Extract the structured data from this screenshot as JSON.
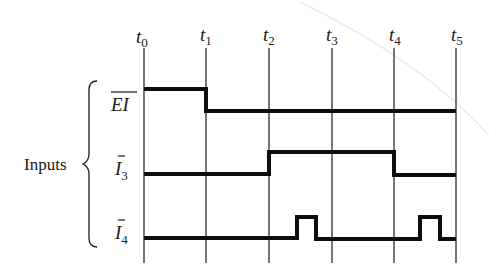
{
  "diagram": {
    "type": "timing-diagram",
    "group_label": "Inputs",
    "time_markers": [
      {
        "base": "t",
        "sub": "0",
        "x": 144
      },
      {
        "base": "t",
        "sub": "1",
        "x": 206
      },
      {
        "base": "t",
        "sub": "2",
        "x": 269
      },
      {
        "base": "t",
        "sub": "3",
        "x": 332
      },
      {
        "base": "t",
        "sub": "4",
        "x": 394
      },
      {
        "base": "t",
        "sub": "5",
        "x": 456
      }
    ],
    "signals": [
      {
        "name": "EI",
        "base": "EI",
        "sub": "",
        "overbar": "full",
        "active_low": true,
        "description": "High from t0 to t1, then low through t5",
        "levels": [
          {
            "from": "t0",
            "to": "t1",
            "level": 1
          },
          {
            "from": "t1",
            "to": "t5",
            "level": 0
          }
        ]
      },
      {
        "name": "I3",
        "base": "I",
        "sub": "3",
        "overbar": "base",
        "active_low": true,
        "description": "Low from t0 to t2, high from t2 to t4, low from t4 to t5",
        "levels": [
          {
            "from": "t0",
            "to": "t2",
            "level": 0
          },
          {
            "from": "t2",
            "to": "t4",
            "level": 1
          },
          {
            "from": "t4",
            "to": "t5",
            "level": 0
          }
        ]
      },
      {
        "name": "I4",
        "base": "I",
        "sub": "4",
        "overbar": "base",
        "active_low": true,
        "description": "Low except for a short high pulse between t2 and t3 and another between t4 and t5",
        "levels": [
          {
            "from": "t0",
            "to": "t2+0.45",
            "level": 0
          },
          {
            "from": "t2+0.45",
            "to": "t2+0.75",
            "level": 1
          },
          {
            "from": "t2+0.75",
            "to": "t4+0.4",
            "level": 0
          },
          {
            "from": "t4+0.4",
            "to": "t4+0.74",
            "level": 1
          },
          {
            "from": "t4+0.74",
            "to": "t5",
            "level": 0
          }
        ]
      }
    ]
  }
}
